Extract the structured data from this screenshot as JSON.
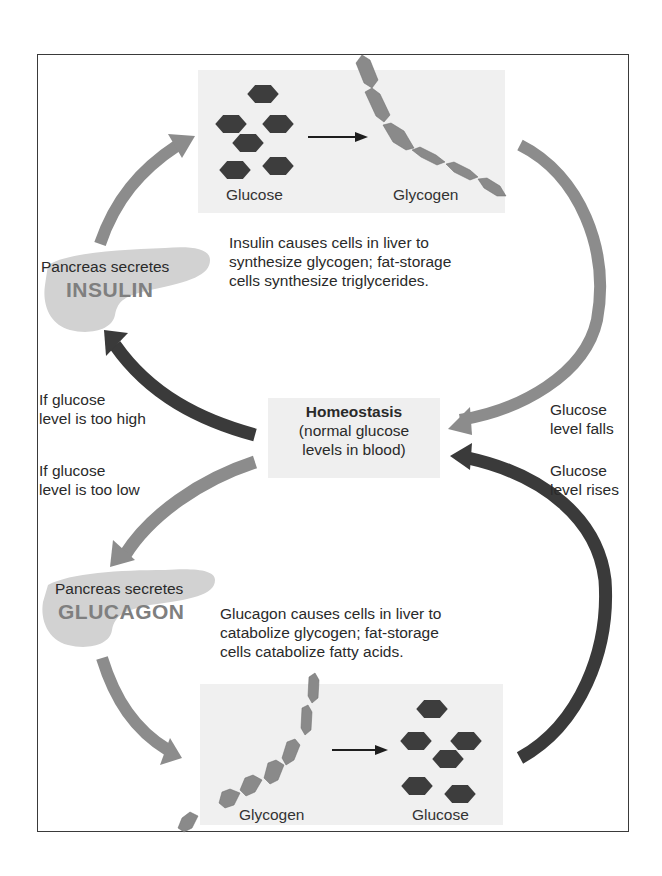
{
  "diagram": {
    "colors": {
      "light_arrow": "#8c8c8c",
      "dark_arrow": "#3a3a3a",
      "glucose_hex": "#3d3d3d",
      "glycogen_hex": "#8a8a8a",
      "panel_bg": "#f0f0f0",
      "pancreas": "#cfcfcf",
      "hormone_text": "#7f7f7f"
    },
    "top_panel": {
      "left_label": "Glucose",
      "right_label": "Glycogen"
    },
    "insulin": {
      "pancreas_label": "Pancreas secretes",
      "hormone": "INSULIN",
      "effect_lines": [
        "Insulin causes cells in liver to",
        "synthesize glycogen; fat-storage",
        "cells synthesize triglycerides."
      ]
    },
    "conditions": {
      "too_high": [
        "If glucose",
        "level is too high"
      ],
      "too_low": [
        "If glucose",
        "level is too low"
      ],
      "falls": [
        "Glucose",
        "level falls"
      ],
      "rises": [
        "Glucose",
        "level rises"
      ]
    },
    "homeostasis": {
      "title": "Homeostasis",
      "line1": "(normal glucose",
      "line2": "levels in blood)"
    },
    "glucagon": {
      "pancreas_label": "Pancreas secretes",
      "hormone": "GLUCAGON",
      "effect_lines": [
        "Glucagon causes cells in liver to",
        "catabolize glycogen; fat-storage",
        "cells catabolize fatty acids."
      ]
    },
    "bottom_panel": {
      "left_label": "Glycogen",
      "right_label": "Glucose"
    }
  }
}
